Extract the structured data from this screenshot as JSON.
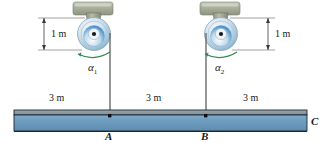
{
  "figure": {
    "background_color": "#ffffff"
  },
  "colors": {
    "beam_fill": "#6d9bbd",
    "beam_top_strip": "#8a9aa2",
    "beam_outline": "#1c2a33",
    "pulley_rim": "#b9cfdd",
    "pulley_face": "#dce8f0",
    "pulley_accent": "#2f7fc1",
    "pulley_hub": "#1a1a1a",
    "bracket": "#9aa08c",
    "bracket_light": "#c9ccbd",
    "cable": "#6b6b6b",
    "arrow_green": "#2e8b57",
    "dimension_line": "#3a3a3a",
    "text": "#1a1a1a"
  },
  "dimensions": {
    "left_vertical": {
      "label": "1 m",
      "name": "left-height-dimension"
    },
    "right_vertical": {
      "label": "1 m",
      "name": "right-height-dimension"
    },
    "span_left": {
      "label": "3 m",
      "name": "span-c-to-a"
    },
    "span_middle": {
      "label": "3 m",
      "name": "span-a-to-b"
    },
    "span_right": {
      "label": "3 m",
      "name": "span-b-to-c"
    }
  },
  "pulleys": [
    {
      "id": "pulley-1",
      "angular_accel_symbol": "α",
      "angular_accel_subscript": "1",
      "height_label": "1 m",
      "rotation": "counterclockwise"
    },
    {
      "id": "pulley-2",
      "angular_accel_symbol": "α",
      "angular_accel_subscript": "2",
      "height_label": "1 m",
      "rotation": "counterclockwise"
    }
  ],
  "beam": {
    "points": [
      {
        "label": "A",
        "name": "point-a"
      },
      {
        "label": "B",
        "name": "point-b"
      },
      {
        "label": "C",
        "name": "point-c"
      }
    ]
  }
}
